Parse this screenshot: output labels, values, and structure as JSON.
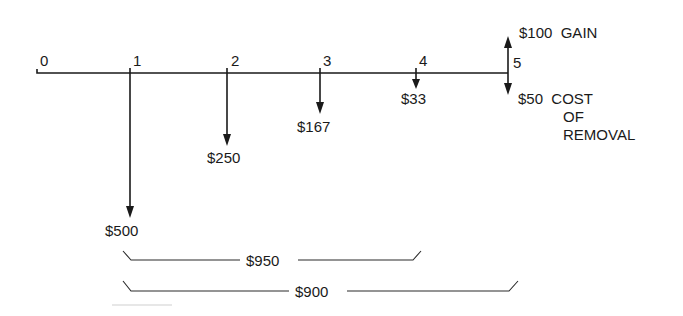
{
  "diagram": {
    "type": "cash-flow-diagram",
    "periods": [
      {
        "label": "0",
        "x": 40
      },
      {
        "label": "1",
        "x": 130
      },
      {
        "label": "2",
        "x": 227
      },
      {
        "label": "3",
        "x": 320
      },
      {
        "label": "4",
        "x": 416
      },
      {
        "label": "5",
        "x": 508
      }
    ],
    "cash_flows": [
      {
        "period": "1",
        "direction": "down",
        "amount": "$500"
      },
      {
        "period": "2",
        "direction": "down",
        "amount": "$250"
      },
      {
        "period": "3",
        "direction": "down",
        "amount": "$167"
      },
      {
        "period": "4",
        "direction": "down",
        "amount": "$33"
      },
      {
        "period": "5",
        "direction": "up",
        "amount": "$100",
        "note": "GAIN"
      },
      {
        "period": "5",
        "direction": "down",
        "amount": "$50",
        "note_lines": [
          "COST",
          "OF",
          "REMOVAL"
        ]
      }
    ],
    "brackets": [
      {
        "label": "$950",
        "from_period": "1",
        "to_period": "4"
      },
      {
        "label": "$900",
        "from_period": "1",
        "to_period": "5"
      }
    ]
  },
  "labels": {
    "p0": "0",
    "p1": "1",
    "p2": "2",
    "p3": "3",
    "p4": "4",
    "p5": "5",
    "a1": "$500",
    "a2": "$250",
    "a3": "$167",
    "a4": "$33",
    "gain": "$100  GAIN",
    "cost_line1": "$50  COST",
    "cost_line2": "OF",
    "cost_line3": "REMOVAL",
    "bracket1": "$950",
    "bracket2": "$900"
  }
}
